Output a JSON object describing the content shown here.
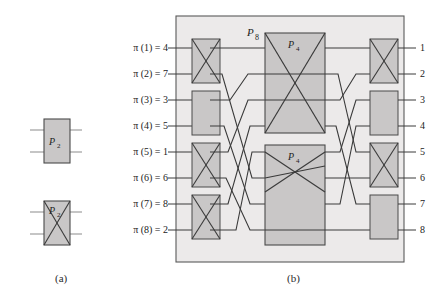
{
  "figure": {
    "title_hidden": "",
    "captions": {
      "a": "(a)",
      "b": "(b)"
    },
    "colors": {
      "panel_fill": "#eceaea",
      "panel_stroke": "#5a5a5a",
      "box_fill": "#c9c7c7",
      "box_stroke": "#4a4a4a",
      "wire": "#3a3a3a",
      "text": "#222222",
      "background": "#ffffff"
    }
  },
  "panel_a": {
    "caption": "(a)",
    "elements": [
      {
        "name": "p2-straight",
        "label_base": "P",
        "label_sub": "2",
        "mode": "straight"
      },
      {
        "name": "p2-crossed",
        "label_base": "P",
        "label_sub": "2",
        "mode": "crossed"
      }
    ]
  },
  "panel_b": {
    "caption": "(b)",
    "network_label_base": "P",
    "network_label_sub": "8",
    "inputs": [
      {
        "text": "π (1) = 4",
        "value": 4
      },
      {
        "text": "π (2) = 7",
        "value": 7
      },
      {
        "text": "π (3) = 3",
        "value": 3
      },
      {
        "text": "π (4) = 5",
        "value": 5
      },
      {
        "text": "π (5) = 1",
        "value": 1
      },
      {
        "text": "π (6) = 6",
        "value": 6
      },
      {
        "text": "π (7) = 8",
        "value": 8
      },
      {
        "text": "π (8) = 2",
        "value": 2
      }
    ],
    "outputs": [
      "1",
      "2",
      "3",
      "4",
      "5",
      "6",
      "7",
      "8"
    ],
    "left_switches": [
      {
        "pair": [
          1,
          2
        ],
        "mode": "crossed"
      },
      {
        "pair": [
          3,
          4
        ],
        "mode": "straight"
      },
      {
        "pair": [
          5,
          6
        ],
        "mode": "crossed"
      },
      {
        "pair": [
          7,
          8
        ],
        "mode": "crossed"
      }
    ],
    "right_switches": [
      {
        "pair": [
          1,
          2
        ],
        "mode": "crossed"
      },
      {
        "pair": [
          3,
          4
        ],
        "mode": "straight"
      },
      {
        "pair": [
          5,
          6
        ],
        "mode": "crossed"
      },
      {
        "pair": [
          7,
          8
        ],
        "mode": "straight"
      }
    ],
    "middle_blocks": [
      {
        "label_base": "P",
        "label_sub": "4",
        "position": "top"
      },
      {
        "label_base": "P",
        "label_sub": "4",
        "position": "bottom"
      }
    ]
  }
}
